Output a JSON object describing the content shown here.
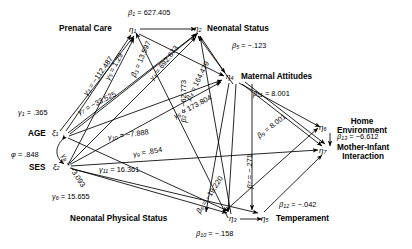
{
  "figure": {
    "type": "path-diagram"
  },
  "latents": [
    {
      "id": "eta1",
      "symbol": "η",
      "index": "1",
      "label": "Prenatal Care",
      "label_side": "left"
    },
    {
      "id": "eta2",
      "symbol": "η",
      "index": "2",
      "label": "Neonatal Status",
      "label_side": "right"
    },
    {
      "id": "eta3",
      "symbol": "η",
      "index": "3",
      "label": "Neonatal Physical Status",
      "label_side": "left"
    },
    {
      "id": "eta4",
      "symbol": "η",
      "index": "4",
      "label": "Maternal Attitudes",
      "label_side": "right"
    },
    {
      "id": "eta5",
      "symbol": "η",
      "index": "5",
      "label": "Temperament",
      "label_side": "right"
    },
    {
      "id": "eta6",
      "symbol": "η",
      "index": "6",
      "label": "Home Environment",
      "label_side": "right"
    },
    {
      "id": "eta7",
      "symbol": "η",
      "index": "7",
      "label": "Mother-Infant Interaction",
      "label_side": "right"
    }
  ],
  "exogenous": [
    {
      "id": "ksi1",
      "symbol": "ξ",
      "index": "1",
      "label": "AGE"
    },
    {
      "id": "ksi2",
      "symbol": "ξ",
      "index": "2",
      "label": "SES"
    }
  ],
  "covariance": {
    "symbol": "φ",
    "value": ".848",
    "text": "φ = .848"
  },
  "paths": [
    {
      "name": "beta1",
      "symbol": "β",
      "index": "1",
      "value": "627.405",
      "text": "β1 = 627.405",
      "from": "eta1",
      "to": "eta2"
    },
    {
      "name": "beta2",
      "symbol": "β",
      "index": "2",
      "value": "-62.773",
      "text": "β2 = -62.773",
      "from": "eta3",
      "to": "eta2"
    },
    {
      "name": "beta3",
      "symbol": "β",
      "index": "3",
      "value": "13.597",
      "text": "β3 = 13.597",
      "from": "eta3",
      "to": "eta1"
    },
    {
      "name": "beta4",
      "symbol": "β",
      "index": "4",
      "value": "164.479",
      "text": "β4 = 164.479",
      "from": "eta1",
      "to": "eta4"
    },
    {
      "name": "beta5",
      "symbol": "β",
      "index": "5",
      "value": "-.123",
      "text": "β5 = -.123",
      "from": "eta2",
      "to": "eta4"
    },
    {
      "name": "beta6",
      "symbol": "β",
      "index": "6",
      "value": "-19.220",
      "text": "β6 = -19.220",
      "from": "eta3",
      "to": "eta6"
    },
    {
      "name": "beta7",
      "symbol": "β",
      "index": "7",
      "value": "-.271",
      "text": "β7 = -.271",
      "from": "eta4",
      "to": "eta7"
    },
    {
      "name": "beta9",
      "symbol": "β",
      "index": "9",
      "value": "8.001",
      "text": "β9 = 8.001",
      "from": "eta4",
      "to": "eta7"
    },
    {
      "name": "beta10",
      "symbol": "β",
      "index": "10",
      "value": "-.158",
      "text": "β10 = -.158",
      "from": "eta3",
      "to": "eta5"
    },
    {
      "name": "beta11",
      "symbol": "β",
      "index": "11",
      "value": "8.001",
      "text": "β11 = 8.001",
      "from": "eta4",
      "to": "eta6"
    },
    {
      "name": "beta12",
      "symbol": "β",
      "index": "12",
      "value": "-.042",
      "text": "β12 = -.042",
      "from": "eta5",
      "to": "eta7"
    },
    {
      "name": "beta13",
      "symbol": "β",
      "index": "13",
      "value": "-6.612",
      "text": "β13 = -6.612",
      "from": "eta6",
      "to": "eta7"
    },
    {
      "name": "gamma1",
      "symbol": "γ",
      "index": "1",
      "value": ".365",
      "text": "γ1 = .365",
      "from": "ksi1",
      "to": "eta1"
    },
    {
      "name": "gamma3",
      "symbol": "γ",
      "index": "3",
      "value": "-112.487",
      "text": "γ3 = -112.487",
      "from": "ksi1",
      "to": "eta2"
    },
    {
      "name": "gamma4",
      "symbol": "γ",
      "index": "4",
      "value": "692.673",
      "text": "γ4 = 692.673",
      "from": "ksi1",
      "to": "eta2"
    },
    {
      "name": "gamma5",
      "symbol": "γ",
      "index": "5",
      "value": "1.29",
      "text": "γ5 = 1.29",
      "from": "ksi1",
      "to": "eta1"
    },
    {
      "name": "gamma6",
      "symbol": "γ",
      "index": "6",
      "value": "173.804",
      "text": "γ6 = 173.804",
      "from": "ksi1",
      "to": "eta4"
    },
    {
      "name": "gamma7",
      "symbol": "γ",
      "index": "7",
      "value": "-33.525",
      "text": "γ7 = -33.525",
      "from": "ksi1",
      "to": "eta3"
    },
    {
      "name": "gamma8",
      "symbol": "γ",
      "index": "8",
      "value": "-3.093",
      "text": "γ8 = -3.093",
      "from": "ksi2",
      "to": "eta1"
    },
    {
      "name": "gamma9",
      "symbol": "γ",
      "index": "9",
      "value": ".854",
      "text": "γ9 = .854",
      "from": "ksi2",
      "to": "eta4"
    },
    {
      "name": "gamma10",
      "symbol": "γ",
      "index": "10",
      "value": "-7.888",
      "text": "γ10 = -7.888",
      "from": "ksi2",
      "to": "eta2"
    },
    {
      "name": "gamma11",
      "symbol": "γ",
      "index": "11",
      "value": "16.361",
      "text": "γ11 = 16.361",
      "from": "ksi2",
      "to": "eta7"
    },
    {
      "name": "gamma6b",
      "symbol": "γ",
      "index": "6",
      "value": "15.655",
      "text": "γ6 = 15.655",
      "from": "ksi2",
      "to": "eta3"
    }
  ],
  "colors": {
    "ink": "#000000",
    "paper": "#ffffff"
  }
}
